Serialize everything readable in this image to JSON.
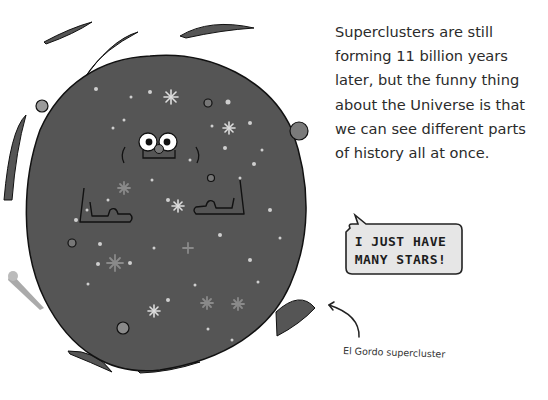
{
  "page": {
    "paragraph_lines": [
      "Superclusters are still",
      "forming 11 billion years",
      "later, but the funny thing",
      "about the Universe is that",
      "we can see different parts",
      "of history all at once."
    ],
    "speech_bubble": {
      "lines": [
        "I JUST HAVE",
        "MANY STARS!"
      ]
    },
    "caption": "El Gordo supercluster",
    "illustration": {
      "subject": "cartoon supercluster blob with face, arms, stars and orbiting planets",
      "colors": {
        "blob": "#555555",
        "outline": "#111111",
        "star": "#cfcfcf",
        "planet": "#8a8a8a",
        "eye": "#ffffff",
        "nose": "#777777"
      }
    }
  }
}
